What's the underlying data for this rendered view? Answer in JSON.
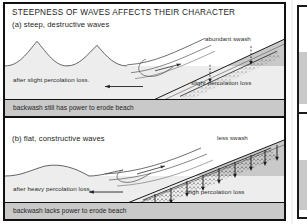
{
  "figure": {
    "title": "STEEPNESS OF WAVES AFFECTS THEIR CHARACTER",
    "colors": {
      "frame": "#111111",
      "beach_fill": "#c9c9c9",
      "water_fill": "#ededed",
      "line": "#3a3a3a",
      "text": "#242424"
    }
  },
  "panels": [
    {
      "id": "a",
      "subtitle": "(a) steep, destructive waves",
      "swash_label": "abundant swash",
      "percolation_label": "slight percolation loss",
      "after_label": "after slight percolation loss.",
      "caption": "backwash still has power to erode beach",
      "wave_type": "steep",
      "arrow_count": 2,
      "arrow_style": "dashed"
    },
    {
      "id": "b",
      "subtitle": "(b) flat, constructive waves",
      "swash_label": "less swash",
      "percolation_label": "high percolation loss",
      "after_label": "after heavy percolation loss.",
      "caption": "backwash lacks power to erode beach",
      "wave_type": "flat",
      "arrow_count": 9,
      "arrow_style": "solid"
    }
  ]
}
